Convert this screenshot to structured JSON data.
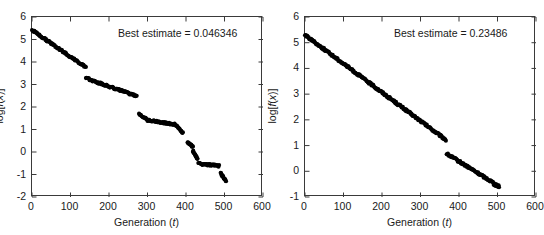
{
  "figure": {
    "background": "#ffffff",
    "marker_color": "#000000",
    "axis_color": "#3a3a3a"
  },
  "chart_data": [
    {
      "type": "scatter",
      "panel": "left",
      "title": "",
      "annotation": "Best estimate = 0.046346",
      "annotation_label": "Best estimate",
      "annotation_value": "0.046346",
      "xlabel_plain": "Generation (t)",
      "xlabel_prefix": "Generation (",
      "xlabel_italic": "t",
      "xlabel_suffix": ")",
      "ylabel": "log[f(x)]",
      "ylabel_prefix": "log[",
      "ylabel_italic": "f",
      "ylabel_mid": "(",
      "ylabel_italic2": "x",
      "ylabel_suffix": ")]",
      "xlim": [
        0,
        600
      ],
      "ylim": [
        -2,
        6
      ],
      "xticks": [
        0,
        100,
        200,
        300,
        400,
        500,
        600
      ],
      "yticks": [
        -2,
        -1,
        0,
        1,
        2,
        3,
        4,
        5,
        6
      ],
      "grid": false,
      "legend": "none",
      "marker": "filled-circle",
      "x": [
        0,
        2,
        4,
        6,
        8,
        10,
        12,
        14,
        16,
        18,
        20,
        22,
        24,
        26,
        28,
        30,
        32,
        34,
        36,
        38,
        40,
        42,
        44,
        46,
        48,
        50,
        52,
        54,
        56,
        58,
        60,
        62,
        64,
        66,
        68,
        70,
        72,
        74,
        76,
        78,
        80,
        82,
        84,
        86,
        88,
        90,
        92,
        94,
        96,
        98,
        100,
        102,
        104,
        106,
        108,
        110,
        112,
        114,
        116,
        118,
        120,
        122,
        124,
        126,
        128,
        130,
        132,
        134,
        136,
        138,
        140,
        278,
        282,
        286,
        290,
        294,
        298,
        302,
        306,
        310,
        314,
        318,
        322,
        326,
        330,
        334,
        338,
        342,
        346,
        350,
        354,
        358,
        362,
        366,
        370,
        374,
        378,
        382,
        386,
        390,
        394,
        398,
        402,
        406,
        410,
        414,
        418,
        422,
        426,
        430,
        434,
        438,
        442,
        446,
        450,
        454,
        458,
        462,
        466,
        470,
        474,
        478,
        482,
        486,
        490,
        494,
        498,
        502
      ],
      "y": [
        5.42,
        5.3,
        5.22,
        5.16,
        5.1,
        5.05,
        5.0,
        4.96,
        4.93,
        4.9,
        4.86,
        4.83,
        4.8,
        4.77,
        4.74,
        4.71,
        4.68,
        4.65,
        4.62,
        4.59,
        4.57,
        4.55,
        4.52,
        4.5,
        4.48,
        4.46,
        4.44,
        4.42,
        4.41,
        4.4,
        4.38,
        4.34,
        4.3,
        4.27,
        4.25,
        4.23,
        4.21,
        4.2,
        4.18,
        4.16,
        4.14,
        4.12,
        4.1,
        4.08,
        4.06,
        4.04,
        4.02,
        4.0,
        3.98,
        3.96,
        3.94,
        3.93,
        3.91,
        3.9,
        3.89,
        3.88,
        3.87,
        3.86,
        3.85,
        3.84,
        3.83,
        3.82,
        3.81,
        3.8,
        3.79,
        3.78,
        3.78,
        3.77,
        3.77,
        3.76,
        3.76,
        3.28,
        3.22,
        3.17,
        3.13,
        3.09,
        3.06,
        3.03,
        3.0,
        2.97,
        2.95,
        2.92,
        2.9,
        2.88,
        2.86,
        2.84,
        2.82,
        2.8,
        2.78,
        2.76,
        2.74,
        2.72,
        2.7,
        2.68,
        2.66,
        2.64,
        2.62,
        2.6,
        2.58,
        2.57,
        2.55,
        2.54,
        2.53,
        2.52,
        2.51,
        2.5,
        2.49,
        2.49,
        2.48,
        2.48,
        2.48,
        2.48,
        2.48,
        2.48,
        2.48,
        2.48,
        2.48,
        2.48,
        2.48,
        2.48,
        2.48,
        2.48,
        2.48,
        2.48,
        2.48,
        2.48,
        2.48,
        2.48
      ],
      "segments": [
        {
          "comment": "segment 1",
          "x_start": 0,
          "x_end": 140,
          "y_start": 5.42,
          "y_end": 3.76
        },
        {
          "comment": "segment 2",
          "x_start": 140,
          "x_end": 272,
          "y_start": 3.28,
          "y_end": 2.48
        },
        {
          "comment": "segment 3",
          "x_start": 278,
          "x_end": 300,
          "y_start": 1.72,
          "y_end": 1.42
        },
        {
          "comment": "segment 4",
          "x_start": 300,
          "x_end": 372,
          "y_start": 1.42,
          "y_end": 1.22
        },
        {
          "comment": "segment 5",
          "x_start": 372,
          "x_end": 392,
          "y_start": 1.22,
          "y_end": 0.85
        },
        {
          "comment": "segment 6",
          "x_start": 404,
          "x_end": 418,
          "y_start": 0.42,
          "y_end": 0.22
        },
        {
          "comment": "segment 7",
          "x_start": 418,
          "x_end": 430,
          "y_start": 0.05,
          "y_end": -0.3
        },
        {
          "comment": "segment 8",
          "x_start": 432,
          "x_end": 486,
          "y_start": -0.52,
          "y_end": -0.62
        },
        {
          "comment": "segment 9",
          "x_start": 490,
          "x_end": 504,
          "y_start": -0.95,
          "y_end": -1.28
        }
      ]
    },
    {
      "type": "scatter",
      "panel": "right",
      "title": "",
      "annotation": "Best estimate = 0.23486",
      "annotation_label": "Best estimate",
      "annotation_value": "0.23486",
      "xlabel_plain": "Generation (t)",
      "xlabel_prefix": "Generation (",
      "xlabel_italic": "t",
      "xlabel_suffix": ")",
      "ylabel": "log[f(x)]",
      "ylabel_prefix": "log[",
      "ylabel_italic": "f",
      "ylabel_mid": "(",
      "ylabel_italic2": "x",
      "ylabel_suffix": ")]",
      "xlim": [
        0,
        600
      ],
      "ylim": [
        -1,
        6
      ],
      "xticks": [
        0,
        100,
        200,
        300,
        400,
        500,
        600
      ],
      "yticks": [
        -1,
        0,
        1,
        2,
        3,
        4,
        5,
        6
      ],
      "grid": false,
      "legend": "none",
      "marker": "filled-circle",
      "x": [
        0,
        4,
        8,
        12,
        16,
        20,
        24,
        28,
        32,
        36,
        40,
        44,
        48,
        52,
        56,
        60,
        64,
        68,
        72,
        76,
        80,
        84,
        88,
        92,
        96,
        100,
        104,
        108,
        112,
        116,
        120,
        124,
        128,
        132,
        136,
        140,
        144,
        148,
        152,
        156,
        160,
        164,
        168,
        172,
        176,
        180,
        184,
        188,
        192,
        196,
        200,
        204,
        208,
        212,
        216,
        220,
        224,
        228,
        232,
        236,
        240,
        244,
        248,
        252,
        256,
        260,
        264,
        268,
        272,
        276,
        280,
        284,
        288,
        292,
        296,
        300,
        304,
        308,
        312,
        316,
        320,
        324,
        328,
        332,
        336,
        340,
        344,
        348,
        352,
        356,
        360,
        364,
        368,
        372,
        376,
        380,
        384,
        388,
        392,
        396,
        400,
        404,
        408,
        412,
        416,
        420,
        424,
        428,
        432,
        436,
        440,
        444,
        448,
        452,
        456,
        460,
        464,
        468,
        472,
        476,
        480,
        484,
        488,
        492,
        496,
        500,
        504
      ],
      "y": [
        5.3,
        5.12,
        4.95,
        4.86,
        4.8,
        4.72,
        4.62,
        4.52,
        4.44,
        4.38,
        4.32,
        4.26,
        4.2,
        4.15,
        4.1,
        4.05,
        4.0,
        3.95,
        3.9,
        3.86,
        3.82,
        3.77,
        3.72,
        3.68,
        3.64,
        3.6,
        3.56,
        3.52,
        3.48,
        3.44,
        3.4,
        3.36,
        3.32,
        3.28,
        3.24,
        3.2,
        3.16,
        3.12,
        3.08,
        3.04,
        3.0,
        2.96,
        2.92,
        2.88,
        2.84,
        2.8,
        2.76,
        2.72,
        2.68,
        2.64,
        2.6,
        2.57,
        2.54,
        2.51,
        2.48,
        2.45,
        2.42,
        2.38,
        2.34,
        2.3,
        2.26,
        2.22,
        2.18,
        2.14,
        2.1,
        2.06,
        2.02,
        1.98,
        1.94,
        1.9,
        1.86,
        1.82,
        1.78,
        1.74,
        1.7,
        1.66,
        1.62,
        1.58,
        1.54,
        1.5,
        1.46,
        1.42,
        1.38,
        1.34,
        1.3,
        1.28,
        1.26,
        1.24,
        1.23,
        1.22,
        1.22,
        1.22,
        0.68,
        0.62,
        0.52,
        0.44,
        0.36,
        0.3,
        0.24,
        0.18,
        0.12,
        0.06,
        0.0,
        -0.05,
        -0.1,
        -0.14,
        -0.18,
        -0.22,
        -0.25,
        -0.28,
        -0.3,
        -0.32,
        -0.34,
        -0.36,
        -0.37,
        -0.38,
        -0.39,
        -0.4,
        -0.41,
        -0.42,
        -0.43,
        -0.5,
        -0.52,
        -0.54,
        -0.56,
        -0.58
      ],
      "segments": [
        {
          "comment": "main descent",
          "x_start": 0,
          "x_end": 366,
          "y_start": 5.3,
          "y_end": 1.22
        },
        {
          "comment": "after jump",
          "x_start": 368,
          "x_end": 488,
          "y_start": 0.68,
          "y_end": -0.43
        },
        {
          "comment": "tail",
          "x_start": 490,
          "x_end": 504,
          "y_start": -0.5,
          "y_end": -0.58
        }
      ]
    }
  ]
}
